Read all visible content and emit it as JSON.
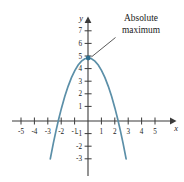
{
  "figure": {
    "background_color": "#ffffff",
    "annotation": {
      "line1": "Absolute",
      "line2": "maximum"
    },
    "axis_labels": {
      "x": "x",
      "y": "y"
    }
  },
  "chart_data": {
    "type": "line",
    "title": "",
    "subtitle": "",
    "xlabel": "x",
    "ylabel": "y",
    "xlim": [
      -5.8,
      6.3
    ],
    "ylim": [
      -3.6,
      7.9
    ],
    "grid": false,
    "legend": null,
    "curve_color": "#5b8fa8",
    "axis_color": "#3b3b3b",
    "x_ticks": [
      -5,
      -4,
      -3,
      -2,
      -1,
      1,
      2,
      3,
      4,
      5
    ],
    "x_tick_labels": [
      "-5",
      "-4",
      "-3",
      "-2",
      "-1",
      "1",
      "2",
      "3",
      "4",
      "5"
    ],
    "y_ticks": [
      -3,
      -2,
      -1,
      1,
      2,
      3,
      4,
      5,
      6,
      7
    ],
    "y_tick_labels": [
      "-3",
      "-2",
      "-1",
      "1",
      "2",
      "3",
      "4",
      "5",
      "6",
      "7"
    ],
    "series": [
      {
        "name": "f(x) = 5 - x^2",
        "equation": "y = 5 - x^2",
        "x": [
          -2.83,
          -2.6,
          -2.4,
          -2.2,
          -2.0,
          -1.75,
          -1.5,
          -1.25,
          -1.0,
          -0.75,
          -0.5,
          -0.25,
          0,
          0.25,
          0.5,
          0.75,
          1.0,
          1.25,
          1.5,
          1.75,
          2.0,
          2.2,
          2.4,
          2.6,
          2.83
        ],
        "y": [
          -3.0,
          -1.76,
          -0.76,
          0.16,
          1.0,
          1.94,
          2.75,
          3.44,
          4.0,
          4.44,
          4.75,
          4.94,
          5.0,
          4.94,
          4.75,
          4.44,
          4.0,
          3.44,
          2.75,
          1.94,
          1.0,
          0.16,
          -0.76,
          -1.76,
          -3.0
        ]
      }
    ],
    "annotations": [
      {
        "text": "Absolute maximum",
        "point_x": 0,
        "point_y": 5,
        "marker": "dot",
        "marker_color": "#2f6f8f"
      }
    ]
  }
}
